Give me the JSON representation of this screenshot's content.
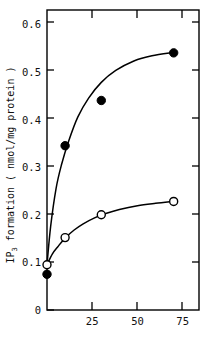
{
  "chart_data": {
    "type": "scatter",
    "title": "",
    "xlabel": "",
    "ylabel": "IP3 formation  ( nmol/mg protein )",
    "ylabel_main": "IP",
    "ylabel_sub": "3",
    "ylabel_rest": " formation  ( nmol/mg protein )",
    "xlim": [
      0,
      84
    ],
    "ylim": [
      0,
      0.63
    ],
    "grid": false,
    "legend": "none",
    "xticks": [
      25,
      50,
      75
    ],
    "xtick_labels": [
      "25",
      "50",
      "75"
    ],
    "yticks": [
      0,
      0.1,
      0.2,
      0.3,
      0.4,
      0.5,
      0.6
    ],
    "ytick_labels": [
      "0",
      "0.1",
      "0.2",
      "0.3",
      "0.4",
      "0.5",
      "0.6"
    ],
    "series": [
      {
        "name": "filled-circles",
        "marker": "filled-circle",
        "color": "#000000",
        "x": [
          0,
          10,
          30,
          70
        ],
        "values": [
          0.075,
          0.345,
          0.44,
          0.54
        ]
      },
      {
        "name": "open-circles",
        "marker": "open-circle",
        "color": "#000000",
        "x": [
          0,
          10,
          30,
          70
        ],
        "values": [
          0.095,
          0.152,
          0.2,
          0.228
        ]
      }
    ],
    "curves": [
      {
        "name": "filled-curve",
        "points": [
          [
            0,
            0.095
          ],
          [
            2,
            0.175
          ],
          [
            5,
            0.255
          ],
          [
            8,
            0.305
          ],
          [
            12,
            0.355
          ],
          [
            17,
            0.405
          ],
          [
            23,
            0.445
          ],
          [
            30,
            0.478
          ],
          [
            38,
            0.503
          ],
          [
            48,
            0.523
          ],
          [
            58,
            0.534
          ],
          [
            70,
            0.541
          ]
        ]
      },
      {
        "name": "open-curve",
        "points": [
          [
            0,
            0.095
          ],
          [
            3,
            0.118
          ],
          [
            6,
            0.133
          ],
          [
            10,
            0.151
          ],
          [
            15,
            0.168
          ],
          [
            20,
            0.181
          ],
          [
            26,
            0.193
          ],
          [
            32,
            0.202
          ],
          [
            40,
            0.211
          ],
          [
            50,
            0.219
          ],
          [
            60,
            0.224
          ],
          [
            70,
            0.228
          ]
        ]
      }
    ]
  },
  "axes": {
    "frame_color": "#000000"
  }
}
